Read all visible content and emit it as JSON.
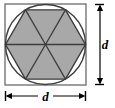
{
  "figure": {
    "shapes": {
      "square": {
        "name": "bounding-square",
        "x": 5,
        "y": 4,
        "width": 81,
        "height": 81,
        "fill": "#ffffff",
        "stroke": "#6b6b6b",
        "stroke_width": 1.3
      },
      "circle": {
        "name": "inscribed-circle",
        "cx": 45.5,
        "cy": 44.5,
        "r": 40.0,
        "fill": "#ffffff",
        "stroke": "#3c3c3c",
        "stroke_width": 1.4
      },
      "hexagon": {
        "name": "inscribed-hexagon",
        "cx": 45.5,
        "cy": 44.5,
        "circumradius": 40.0,
        "sides": 6,
        "orientation": "flat-top",
        "fill": "#a8a8a8",
        "stroke": "#3c3c3c",
        "stroke_width": 1.4
      },
      "triangles": {
        "name": "hexagon-sector-triangles",
        "count": 6,
        "fill": "#a8a8a8",
        "stroke": "#3c3c3c",
        "stroke_width": 1.3
      }
    },
    "dimensions": [
      {
        "id": "height-dimension",
        "label": "d",
        "orientation": "vertical",
        "x": 100,
        "y_start": 4,
        "y_end": 85,
        "label_x": 105,
        "label_y": 49
      },
      {
        "id": "width-dimension",
        "label": "d",
        "orientation": "horizontal",
        "y": 96,
        "x_start": 5,
        "x_end": 86,
        "label_x": 45.5,
        "label_y": 101
      }
    ],
    "colors": {
      "shaded_fill": "#a8a8a8",
      "background": "#ffffff",
      "outline": "#3c3c3c",
      "frame_outline": "#6b6b6b",
      "dimension_line": "#000000"
    }
  }
}
